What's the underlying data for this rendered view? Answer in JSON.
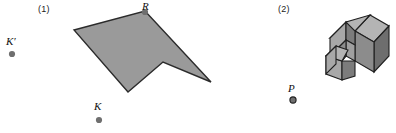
{
  "figure": {
    "width": 396,
    "height": 133,
    "background": "#ffffff",
    "panels": [
      {
        "caption": "(1)",
        "caption_x": 38,
        "caption_y": 5,
        "type": "polygon-with-centers"
      },
      {
        "caption": "(2)",
        "caption_x": 278,
        "caption_y": 5,
        "type": "isometric-solid-with-point"
      }
    ]
  },
  "panel1": {
    "caption": "(1)",
    "polygon": {
      "name": "arrow-polygon",
      "fill": "#9a9a9a",
      "stroke": "#2b2b2b",
      "stroke_width": 1.4,
      "points": "74,30 145,11 211,82 163,62 128,92"
    },
    "vertices": [
      {
        "label": "R",
        "x": 145,
        "y": 11
      }
    ],
    "points": [
      {
        "name": "point-k-prime",
        "label": "K′",
        "label_x": 6,
        "label_y": 36,
        "dot_x": 12,
        "dot_y": 54,
        "dot_r": 3.1,
        "dot_fill": "#6f6f6f"
      },
      {
        "name": "point-r",
        "label": "R",
        "label_x": 142,
        "label_y": 1,
        "dot_x": 145,
        "dot_y": 12,
        "dot_r": 3.1,
        "dot_fill": "#6f6f6f"
      },
      {
        "name": "point-k",
        "label": "K",
        "label_x": 94,
        "label_y": 101,
        "dot_x": 99,
        "dot_y": 120,
        "dot_r": 3.1,
        "dot_fill": "#6f6f6f"
      }
    ]
  },
  "panel2": {
    "caption": "(2)",
    "solid": {
      "name": "isometric-block-solid",
      "stroke": "#1f1f1f",
      "stroke_width": 1.1,
      "face_top_fill": "#b4b4b4",
      "face_left_fill": "#a8a8a8",
      "face_right_fill": "#6e6e6e",
      "face_front_fill": "#8c8c8c",
      "face_inner_fill": "#7c7c7c"
    },
    "points": [
      {
        "name": "point-p",
        "label": "P",
        "label_x": 288,
        "label_y": 83,
        "dot_x": 293,
        "dot_y": 100,
        "dot_r": 3.1,
        "dot_fill": "#6f6f6f"
      }
    ]
  }
}
